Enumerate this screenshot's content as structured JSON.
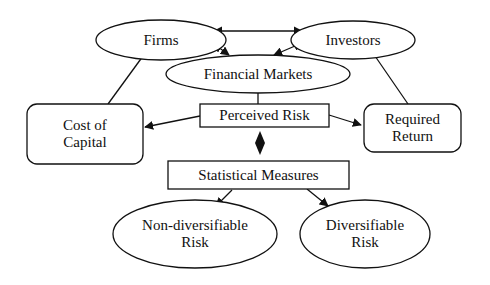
{
  "diagram": {
    "nodes": {
      "firms": {
        "label": "Firms",
        "shape": "ellipse"
      },
      "investors": {
        "label": "Investors",
        "shape": "ellipse"
      },
      "financial_markets": {
        "label": "Financial Markets",
        "shape": "ellipse"
      },
      "cost_of_capital": {
        "line1": "Cost of",
        "line2": "Capital",
        "shape": "rounded-rect"
      },
      "perceived_risk": {
        "label": "Perceived Risk",
        "shape": "rect"
      },
      "required_return": {
        "line1": "Required",
        "line2": "Return",
        "shape": "rounded-rect"
      },
      "statistical_measures": {
        "label": "Statistical Measures",
        "shape": "rect"
      },
      "non_diversifiable_risk": {
        "line1": "Non-diversifiable",
        "line2": "Risk",
        "shape": "ellipse"
      },
      "diversifiable_risk": {
        "line1": "Diversifiable",
        "line2": "Risk",
        "shape": "ellipse"
      }
    },
    "edges": [
      {
        "from": "Firms",
        "to": "Investors",
        "type": "bidirectional-arrow"
      },
      {
        "from": "Firms",
        "to": "Financial Markets",
        "type": "bidirectional-arrow"
      },
      {
        "from": "Investors",
        "to": "Financial Markets",
        "type": "bidirectional-arrow"
      },
      {
        "from": "Firms",
        "to": "Cost of Capital",
        "type": "line"
      },
      {
        "from": "Investors",
        "to": "Required Return",
        "type": "line"
      },
      {
        "from": "Financial Markets",
        "to": "Perceived Risk",
        "type": "line"
      },
      {
        "from": "Perceived Risk",
        "to": "Cost of Capital",
        "type": "arrow"
      },
      {
        "from": "Perceived Risk",
        "to": "Required Return",
        "type": "arrow"
      },
      {
        "from": "Perceived Risk",
        "to": "Statistical Measures",
        "type": "diamond-connector"
      },
      {
        "from": "Statistical Measures",
        "to": "Non-diversifiable Risk",
        "type": "arrow"
      },
      {
        "from": "Statistical Measures",
        "to": "Diversifiable Risk",
        "type": "arrow"
      }
    ]
  }
}
